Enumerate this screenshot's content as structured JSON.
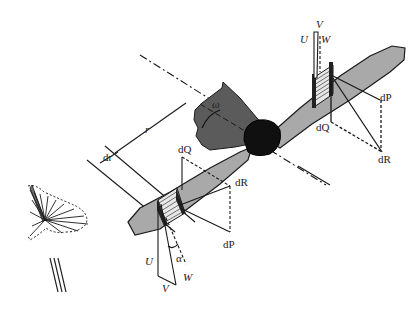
{
  "diagram": {
    "colors": {
      "blade_fill": "#a9a9a9",
      "hub_fill": "#101010",
      "disc_fill": "#5b5b5b",
      "stroke": "#1a1a1a",
      "background": "#ffffff"
    },
    "labels": {
      "omega": "ω",
      "r": "r",
      "dr": "dr",
      "alpha": "α",
      "upper": {
        "V": "V",
        "U": "U",
        "W": "W",
        "dP": "dP",
        "dQ": "dQ",
        "dR": "dR"
      },
      "lower": {
        "V": "V",
        "U": "U",
        "W": "W",
        "dP": "dP",
        "dQ": "dQ",
        "dR": "dR"
      }
    }
  }
}
